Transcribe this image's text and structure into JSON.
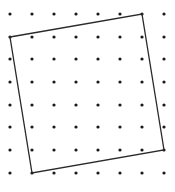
{
  "diagram": {
    "type": "dot-grid-with-tilted-square",
    "background": "#ffffff",
    "dot_color": "#1a1a1a",
    "line_color": "#2a2a2a",
    "dot_radius": 1.6,
    "line_width": 1.3,
    "grid": {
      "cols_x": [
        10,
        32,
        54,
        76,
        98,
        120,
        142,
        164
      ],
      "rows_y": [
        14,
        37,
        59,
        82,
        105,
        127,
        150,
        173
      ]
    },
    "square": {
      "vertices_grid": [
        [
          0,
          1
        ],
        [
          6,
          0
        ],
        [
          7,
          6
        ],
        [
          1,
          7
        ]
      ],
      "vertices_px": [
        [
          10,
          37
        ],
        [
          142,
          14
        ],
        [
          164,
          150
        ],
        [
          32,
          173
        ]
      ]
    }
  }
}
